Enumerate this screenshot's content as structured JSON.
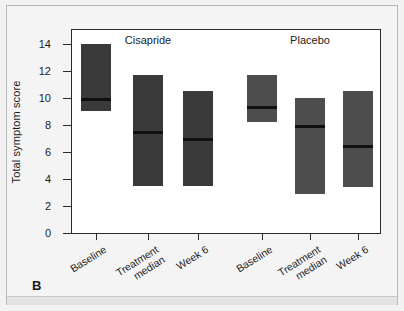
{
  "figure": {
    "panel_letter": "B",
    "background_color": "#f2f2f2",
    "plot_background_color": "#ffffff",
    "frame_color": "#2b2b2b"
  },
  "chart_data": {
    "type": "bar",
    "title": "",
    "xlabel": "",
    "ylabel": "Total symptom score",
    "ylim": [
      0,
      15
    ],
    "yticks": [
      0,
      2,
      4,
      6,
      8,
      10,
      12,
      14
    ],
    "ytick_labels": [
      "0",
      "2",
      "4",
      "6",
      "8",
      "10",
      "12",
      "14"
    ],
    "grid": false,
    "legend": "none",
    "group_labels": [
      "Cisapride",
      "Placebo"
    ],
    "categories": [
      "Baseline",
      "Treatment median",
      "Week 6",
      "Baseline",
      "Treatment median",
      "Week 6"
    ],
    "bar_colors": [
      "#3a3a3a",
      "#3a3a3a",
      "#3a3a3a",
      "#4d4d4d",
      "#4d4d4d",
      "#4d4d4d"
    ],
    "median_color": "#101010",
    "bars": [
      {
        "group": "Cisapride",
        "category": "Baseline",
        "low": 9.0,
        "high": 14.0,
        "median": 9.9,
        "color": "#3a3a3a"
      },
      {
        "group": "Cisapride",
        "category": "Treatment median",
        "low": 3.5,
        "high": 11.7,
        "median": 7.45,
        "color": "#3a3a3a"
      },
      {
        "group": "Cisapride",
        "category": "Week 6",
        "low": 3.5,
        "high": 10.5,
        "median": 6.9,
        "color": "#3a3a3a"
      },
      {
        "group": "Placebo",
        "category": "Baseline",
        "low": 8.2,
        "high": 11.7,
        "median": 9.3,
        "color": "#4d4d4d"
      },
      {
        "group": "Placebo",
        "category": "Treatment median",
        "low": 2.9,
        "high": 10.0,
        "median": 7.85,
        "color": "#4d4d4d"
      },
      {
        "group": "Placebo",
        "category": "Week 6",
        "low": 3.4,
        "high": 10.5,
        "median": 6.4,
        "color": "#4d4d4d"
      }
    ]
  },
  "axis": {
    "y_title": "Total symptom score",
    "y_labels": [
      "14",
      "12",
      "10",
      "8",
      "6",
      "4",
      "2",
      "0"
    ]
  },
  "x_labels": [
    {
      "line1": "Baseline",
      "line2": ""
    },
    {
      "line1": "Treatment",
      "line2": "median"
    },
    {
      "line1": "Week 6",
      "line2": ""
    },
    {
      "line1": "Baseline",
      "line2": ""
    },
    {
      "line1": "Treatment",
      "line2": "median"
    },
    {
      "line1": "Week 6",
      "line2": ""
    }
  ],
  "groups": [
    {
      "label": "Cisapride"
    },
    {
      "label": "Placebo"
    }
  ]
}
